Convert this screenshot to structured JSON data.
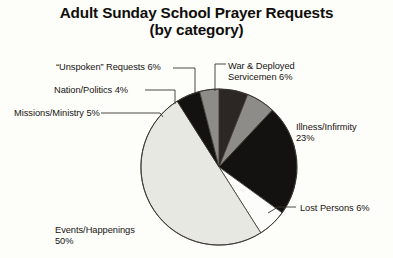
{
  "title": {
    "line1": "Adult Sunday School Prayer Requests",
    "line2": "(by category)"
  },
  "labels": {
    "unspoken": {
      "line1": "“Unspoken” Requests 6%"
    },
    "nation": {
      "line1": "Nation/Politics 4%"
    },
    "missions": {
      "line1": "Missions/Ministry 5%"
    },
    "war": {
      "line1": "War & Deployed",
      "line2": "Servicemen 6%"
    },
    "illness": {
      "line1": "Illness/Infirmity",
      "line2": "23%"
    },
    "lost": {
      "line1": "Lost Persons 6%"
    },
    "events": {
      "line1": "Events/Happenings",
      "line2": "50%"
    }
  },
  "colors": {
    "background": "#fdfdfa",
    "text": "#14110f",
    "outline": "#39332e",
    "slice_black": "#141210",
    "slice_dark": "#2c2724",
    "slice_gray": "#8d8c88",
    "slice_white": "#fcfcfa",
    "slice_light_gray": "#e8e8e3"
  },
  "chart_data": {
    "type": "pie",
    "title": "Adult Sunday School Prayer Requests (by category)",
    "subtitle": "(by category)",
    "legend_position": "callout-labels",
    "unit": "percent",
    "total": 100,
    "categories": [
      "Events/Happenings",
      "Illness/Infirmity",
      "War & Deployed Servicemen",
      "“Unspoken” Requests",
      "Lost Persons",
      "Missions/Ministry",
      "Nation/Politics"
    ],
    "values": [
      50,
      23,
      6,
      6,
      6,
      5,
      4
    ],
    "slices": [
      {
        "label": "“Unspoken” Requests",
        "value": 6,
        "display": "6%",
        "fill": "#2c2724",
        "start_deg": 0,
        "end_deg": 21.6
      },
      {
        "label": "War & Deployed Servicemen",
        "value": 6,
        "display": "6%",
        "fill": "#8d8c88",
        "start_deg": 21.6,
        "end_deg": 43.2
      },
      {
        "label": "Illness/Infirmity",
        "value": 23,
        "display": "23%",
        "fill": "#141210",
        "start_deg": 43.2,
        "end_deg": 126.0
      },
      {
        "label": "Lost Persons",
        "value": 6,
        "display": "6%",
        "fill": "#fcfcfa",
        "start_deg": 126.0,
        "end_deg": 147.6
      },
      {
        "label": "Events/Happenings",
        "value": 50,
        "display": "50%",
        "fill": "#e8e8e3",
        "start_deg": 147.6,
        "end_deg": 327.6
      },
      {
        "label": "Missions/Ministry",
        "value": 5,
        "display": "5%",
        "fill": "#141210",
        "start_deg": 327.6,
        "end_deg": 345.6
      },
      {
        "label": "Nation/Politics",
        "value": 4,
        "display": "4%",
        "fill": "#8d8c88",
        "start_deg": 345.6,
        "end_deg": 360.0
      }
    ],
    "geometry": {
      "cx": 219,
      "cy": 167,
      "r": 78
    }
  }
}
